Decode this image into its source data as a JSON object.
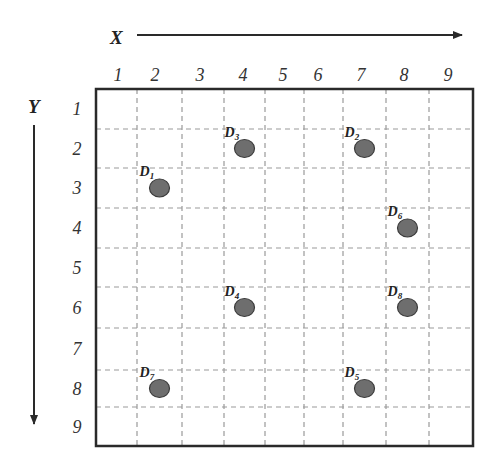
{
  "diagram": {
    "x_axis": {
      "title": "X",
      "ticks": [
        "1",
        "2",
        "3",
        "4",
        "5",
        "6",
        "7",
        "8",
        "9"
      ]
    },
    "y_axis": {
      "title": "Y",
      "ticks": [
        "1",
        "2",
        "3",
        "4",
        "5",
        "6",
        "7",
        "8",
        "9"
      ]
    },
    "grid": {
      "columns": 9,
      "rows": 9
    },
    "points": [
      {
        "label": "D",
        "sub": "1",
        "col": 2,
        "row": 3
      },
      {
        "label": "D",
        "sub": "2",
        "col": 7,
        "row": 2
      },
      {
        "label": "D",
        "sub": "3",
        "col": 4,
        "row": 2
      },
      {
        "label": "D",
        "sub": "4",
        "col": 4,
        "row": 6
      },
      {
        "label": "D",
        "sub": "5",
        "col": 7,
        "row": 8
      },
      {
        "label": "D",
        "sub": "6",
        "col": 8,
        "row": 4
      },
      {
        "label": "D",
        "sub": "7",
        "col": 2,
        "row": 8
      },
      {
        "label": "D",
        "sub": "8",
        "col": 8,
        "row": 6
      }
    ],
    "colors": {
      "frame": "#2a2a2a",
      "grid": "#9a9a9a",
      "point_fill": "#6e6e6e",
      "point_stroke": "#3a3a3a",
      "axis": "#2a2a2a"
    }
  }
}
